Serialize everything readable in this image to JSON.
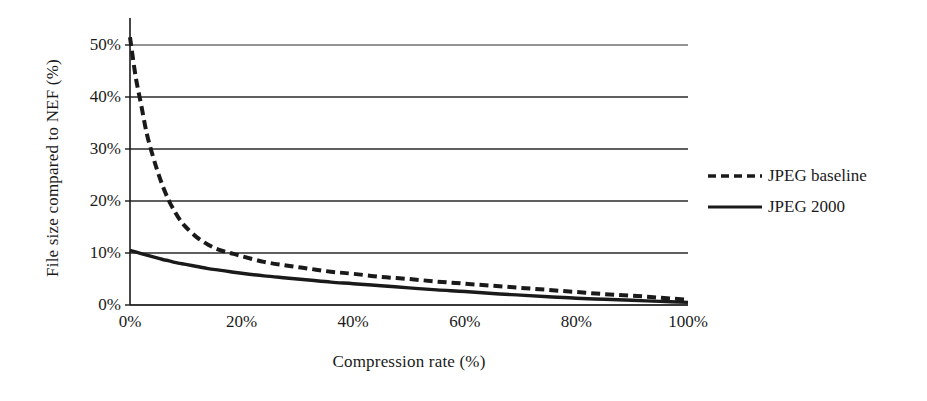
{
  "chart_data": {
    "type": "line",
    "title": "",
    "xlabel": "Compression rate (%)",
    "ylabel": "File size compared to NEF (%)",
    "xlim": [
      0,
      100
    ],
    "ylim": [
      0,
      50
    ],
    "grid": true,
    "grid_axis": "y",
    "legend_position": "right",
    "xticks": [
      "0%",
      "20%",
      "40%",
      "60%",
      "80%",
      "100%"
    ],
    "xtick_values": [
      0,
      20,
      40,
      60,
      80,
      100
    ],
    "yticks": [
      "0%",
      "10%",
      "20%",
      "30%",
      "40%",
      "50%"
    ],
    "ytick_values": [
      0,
      10,
      20,
      30,
      40,
      50
    ],
    "x": [
      0,
      1,
      2,
      3,
      4,
      5,
      6,
      7,
      8,
      9,
      10,
      12,
      14,
      16,
      18,
      20,
      24,
      28,
      32,
      36,
      40,
      45,
      50,
      55,
      60,
      65,
      70,
      75,
      80,
      85,
      90,
      95,
      100
    ],
    "series": [
      {
        "name": "JPEG baseline",
        "style": "dashed",
        "color": "#1a1a1a",
        "values": [
          51.5,
          44.0,
          38.5,
          33.0,
          29.0,
          25.5,
          22.5,
          20.0,
          18.0,
          16.3,
          15.0,
          13.0,
          11.6,
          10.6,
          10.0,
          9.4,
          8.3,
          7.6,
          7.0,
          6.4,
          6.0,
          5.4,
          5.0,
          4.5,
          4.1,
          3.7,
          3.3,
          2.9,
          2.5,
          2.1,
          1.8,
          1.4,
          1.0
        ]
      },
      {
        "name": "JPEG 2000",
        "style": "solid",
        "color": "#1a1a1a",
        "values": [
          10.5,
          10.2,
          9.9,
          9.6,
          9.3,
          9.0,
          8.7,
          8.5,
          8.2,
          8.0,
          7.8,
          7.4,
          7.0,
          6.7,
          6.4,
          6.1,
          5.6,
          5.2,
          4.8,
          4.4,
          4.1,
          3.7,
          3.3,
          2.9,
          2.6,
          2.2,
          1.9,
          1.6,
          1.3,
          1.1,
          0.9,
          0.7,
          0.5
        ]
      }
    ]
  },
  "legend": {
    "items": [
      {
        "label": "JPEG baseline",
        "style": "dashed"
      },
      {
        "label": "JPEG 2000",
        "style": "solid"
      }
    ]
  },
  "axes": {
    "y_title": "File size compared to NEF (%)",
    "x_title": "Compression rate (%)"
  },
  "colors": {
    "ink": "#1a1a1a",
    "grid": "#2a2a2a",
    "background": "#ffffff"
  }
}
